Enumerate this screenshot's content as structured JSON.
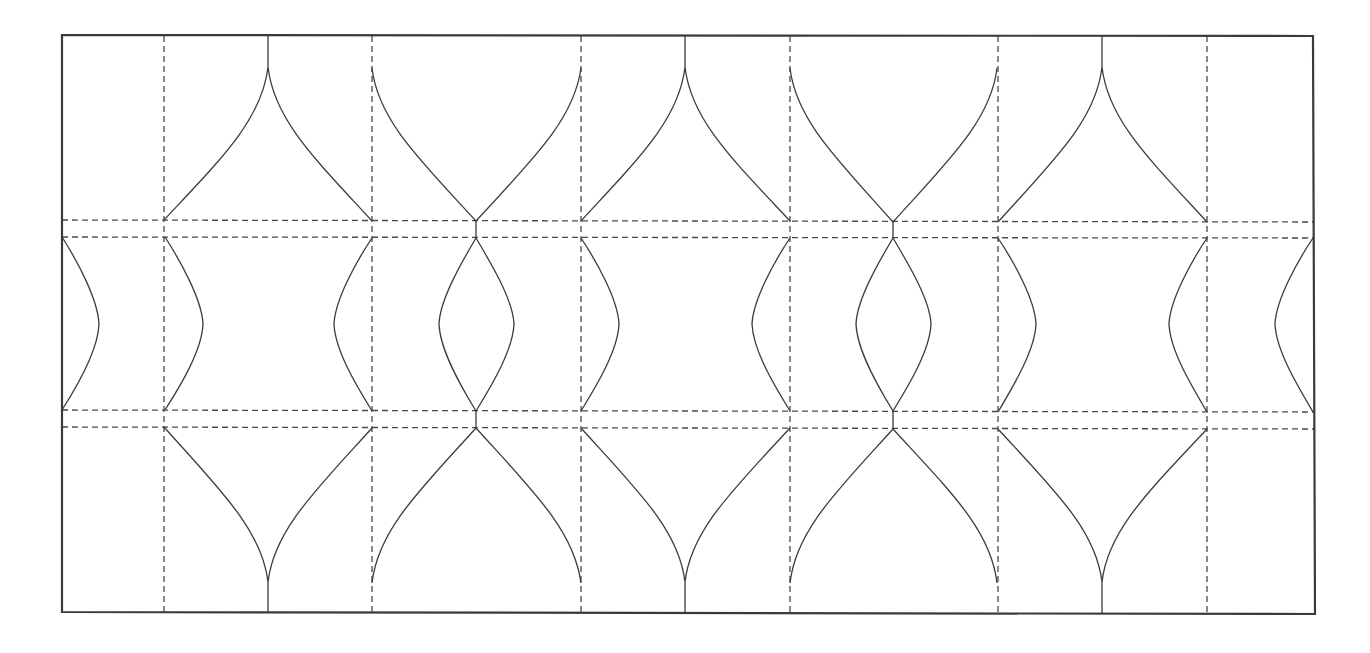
{
  "diagram": {
    "type": "tessellated-curve-pattern",
    "colors": {
      "background": "#ffffff",
      "frame": "#3a3a3a",
      "dashed_guides": "#4a4a4a",
      "curves": "#3c3c3c"
    },
    "frame": {
      "top_left": [
        62,
        35
      ],
      "top_right": [
        1313,
        36
      ],
      "bottom_right": [
        1315,
        614
      ],
      "bottom_left": [
        62,
        612
      ]
    },
    "dashed_verticals_x": [
      164,
      372,
      581,
      790,
      998,
      1207
    ],
    "dashed_horizontals": [
      {
        "y_left": 220,
        "y_right": 222
      },
      {
        "y_left": 237,
        "y_right": 238
      },
      {
        "y_left": 410,
        "y_right": 412
      },
      {
        "y_left": 427,
        "y_right": 429
      }
    ],
    "column_centers_x": [
      268,
      477,
      685,
      893,
      1102
    ],
    "top_row": {
      "arches_cusp_up_x": [
        268,
        685,
        1102
      ],
      "cups_concave_x": [
        477,
        893
      ],
      "cusp_tip_y": 67
    },
    "middle_row": {
      "lenses_x": [
        477,
        893
      ],
      "left_edge_bulge_peak": [
        99,
        324
      ],
      "right_edge_bulge_peak": [
        1275,
        324
      ]
    },
    "bottom_row": {
      "arches_cusp_down_x": [
        268,
        685,
        1102
      ],
      "cups_concave_x": [
        477,
        893
      ],
      "cusp_tip_y": 582
    }
  }
}
